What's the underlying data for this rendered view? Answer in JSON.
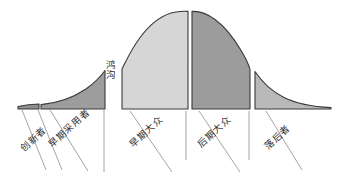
{
  "diagram": {
    "baseline_y": 109,
    "palette": {
      "innovators_fill": "#8f8f8f",
      "early_adopters_fill": "#9d9d9d",
      "early_majority_fill": "#d6d6d6",
      "late_majority_fill": "#9c9c9c",
      "laggards_fill": "#b9b9b9",
      "outline": "#3a3a3a",
      "leader_line": "#8d8d8d",
      "background": "#ffffff",
      "text": "#2e2e2e"
    },
    "chasm": {
      "label": "鸿沟",
      "chars": [
        "鸿",
        "沟"
      ]
    },
    "segments": [
      {
        "id": "innovators",
        "label": "创新者",
        "fill": "#8f8f8f",
        "x_start": 18,
        "x_end": 39,
        "peak_height": 5,
        "label_x": 24,
        "label_y": 152,
        "leader_from_x": 22,
        "leader_from_y": 110,
        "leader_to_x": 46,
        "leader_to_y": 170
      },
      {
        "id": "early-adopters",
        "label": "早期采用者",
        "fill": "#9d9d9d",
        "x_start": 41,
        "x_end": 105,
        "peak_height": 32,
        "label_x": 52,
        "label_y": 148,
        "leader_from_x": 50,
        "leader_from_y": 110,
        "leader_to_x": 88,
        "leader_to_y": 171
      },
      {
        "id": "early-majority",
        "label": "早期大众",
        "fill": "#d6d6d6",
        "x_start": 122,
        "x_end": 188,
        "peak_height": 95,
        "label_x": 133,
        "label_y": 148,
        "leader_from_x": 130,
        "leader_from_y": 111,
        "leader_to_x": 172,
        "leader_to_y": 172
      },
      {
        "id": "late-majority",
        "label": "后期大众",
        "fill": "#9c9c9c",
        "x_start": 192,
        "x_end": 250,
        "peak_height": 95,
        "label_x": 201,
        "label_y": 148,
        "leader_from_x": 199,
        "leader_from_y": 111,
        "leader_to_x": 240,
        "leader_to_y": 172
      },
      {
        "id": "laggards",
        "label": "落后者",
        "fill": "#b9b9b9",
        "x_start": 255,
        "x_end": 331,
        "peak_height": 36,
        "label_x": 268,
        "label_y": 150,
        "leader_from_x": 266,
        "leader_from_y": 111,
        "leader_to_x": 302,
        "leader_to_y": 170
      }
    ]
  }
}
